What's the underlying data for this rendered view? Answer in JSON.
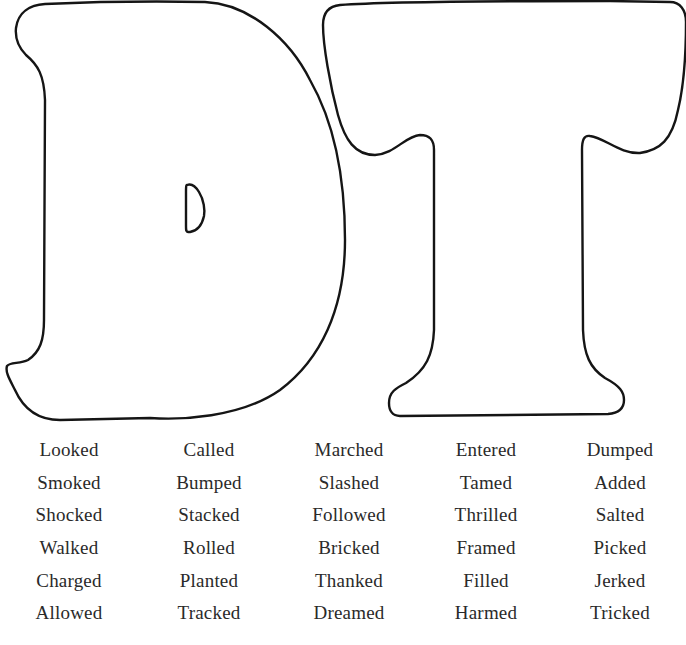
{
  "page": {
    "title_letters": [
      "D",
      "T"
    ],
    "theme": "-ed ending sounds: d and t"
  },
  "colors": {
    "outline": "#151515",
    "text": "#2a2a2a",
    "background": "#ffffff"
  },
  "word_rows": [
    [
      "Looked",
      "Called",
      "Marched",
      "Entered",
      "Dumped"
    ],
    [
      "Smoked",
      "Bumped",
      "Slashed",
      "Tamed",
      "Added"
    ],
    [
      "Shocked",
      "Stacked",
      "Followed",
      "Thrilled",
      "Salted"
    ],
    [
      "Walked",
      "Rolled",
      "Bricked",
      "Framed",
      "Picked"
    ],
    [
      "Charged",
      "Planted",
      "Thanked",
      "Filled",
      "Jerked"
    ],
    [
      "Allowed",
      "Tracked",
      "Dreamed",
      "Harmed",
      "Tricked"
    ]
  ]
}
